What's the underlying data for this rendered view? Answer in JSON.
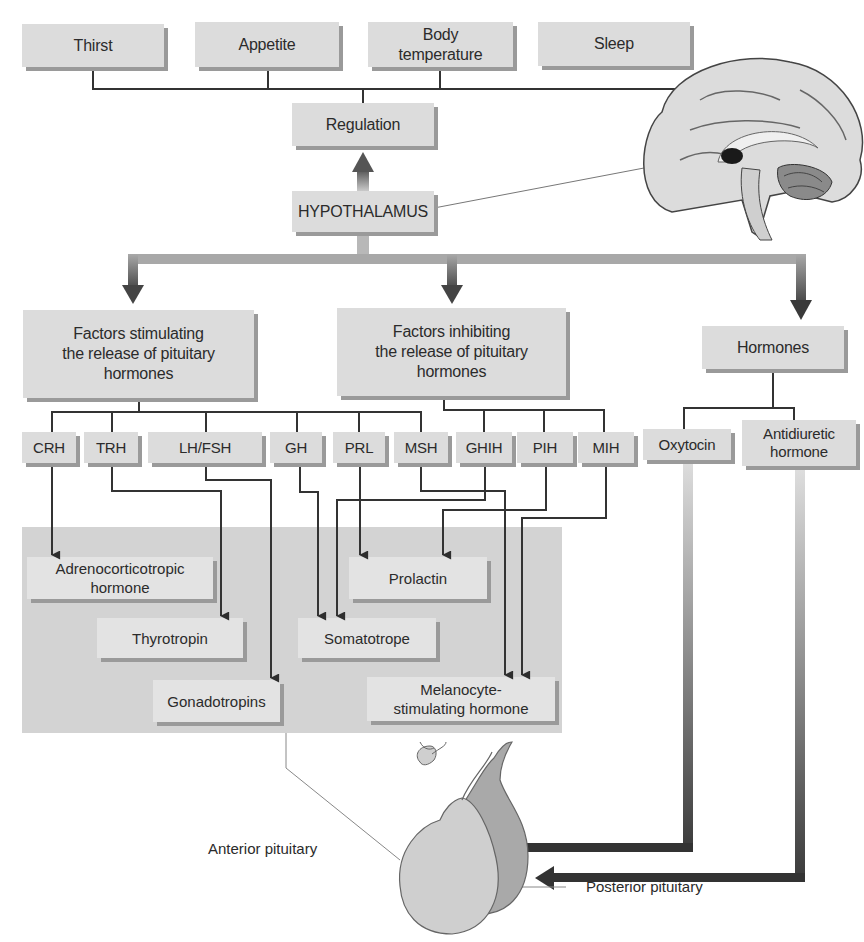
{
  "diagram": {
    "title_center": "HYPOTHALAMUS",
    "regulation": {
      "label": "Regulation",
      "targets": [
        "Thirst",
        "Appetite",
        "Body temperature",
        "Sleep"
      ]
    },
    "categories": {
      "stimulating": "Factors stimulating the release of pituitary hormones",
      "inhibiting": "Factors inhibiting the release of pituitary hormones",
      "hormones": "Hormones"
    },
    "releasing_factors": [
      "CRH",
      "TRH",
      "LH/FSH",
      "GH",
      "PRL",
      "MSH"
    ],
    "inhibiting_factors": [
      "GHIH",
      "PIH",
      "MIH"
    ],
    "neurohormones": [
      "Oxytocin",
      "Antidiuretic hormone"
    ],
    "anterior_products": [
      "Adrenocorticotropic hormone",
      "Thyrotropin",
      "Gonadotropins",
      "Prolactin",
      "Somatotrope",
      "Melanocyte-stimulating hormone"
    ],
    "edges": [
      {
        "from": "CRH",
        "to": "Adrenocorticotropic hormone"
      },
      {
        "from": "TRH",
        "to": "Thyrotropin"
      },
      {
        "from": "LH/FSH",
        "to": "Gonadotropins"
      },
      {
        "from": "GH",
        "to": "Somatotrope"
      },
      {
        "from": "PRL",
        "to": "Prolactin"
      },
      {
        "from": "MSH",
        "to": "Melanocyte-stimulating hormone"
      },
      {
        "from": "GHIH",
        "to": "Somatotrope"
      },
      {
        "from": "PIH",
        "to": "Prolactin"
      },
      {
        "from": "MIH",
        "to": "Melanocyte-stimulating hormone"
      },
      {
        "from": "Oxytocin",
        "to": "Posterior pituitary"
      },
      {
        "from": "Antidiuretic hormone",
        "to": "Posterior pituitary"
      }
    ],
    "labels": {
      "anterior": "Anterior pituitary",
      "posterior": "Posterior pituitary"
    }
  },
  "text": {
    "thirst": "Thirst",
    "appetite": "Appetite",
    "body_temp_1": "Body",
    "body_temp_2": "temperature",
    "sleep": "Sleep",
    "regulation": "Regulation",
    "hypothalamus": "HYPOTHALAMUS",
    "stim_1": "Factors stimulating",
    "stim_2": "the release of pituitary",
    "stim_3": "hormones",
    "inh_1": "Factors inhibiting",
    "inh_2": "the release of pituitary",
    "inh_3": "hormones",
    "hormones": "Hormones",
    "crh": "CRH",
    "trh": "TRH",
    "lhfsh": "LH/FSH",
    "gh": "GH",
    "prl": "PRL",
    "msh": "MSH",
    "ghih": "GHIH",
    "pih": "PIH",
    "mih": "MIH",
    "oxytocin": "Oxytocin",
    "adh_1": "Antidiuretic",
    "adh_2": "hormone",
    "acth_1": "Adrenocorticotropic",
    "acth_2": "hormone",
    "thyrotropin": "Thyrotropin",
    "gonadotropins": "Gonadotropins",
    "prolactin": "Prolactin",
    "somatotrope": "Somatotrope",
    "msh_prod_1": "Melanocyte-",
    "msh_prod_2": "stimulating hormone",
    "anterior": "Anterior pituitary",
    "posterior": "Posterior pituitary"
  },
  "colors": {
    "box_fill": "#dcdcdc",
    "box_shadow": "#9a9a9a",
    "panel_fill": "#d3d3d3",
    "line": "#333333",
    "arrow_dark": "#3a3a3a"
  }
}
